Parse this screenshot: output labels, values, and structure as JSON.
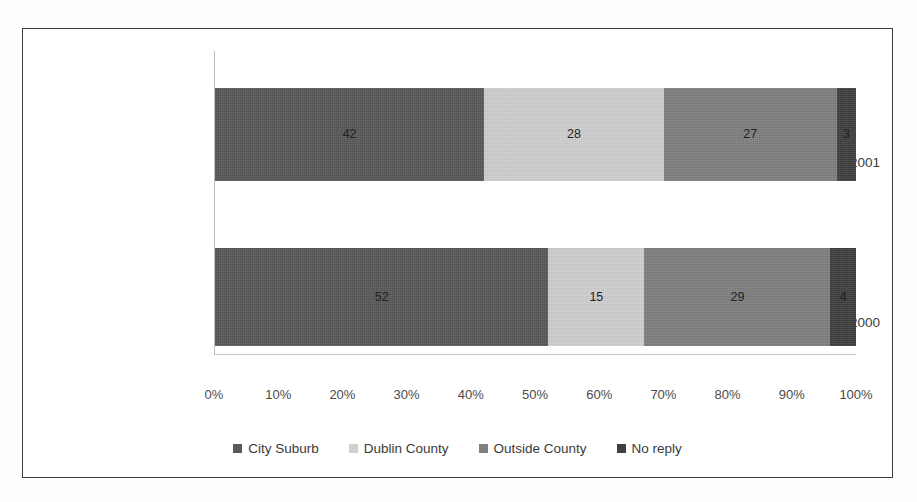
{
  "chart_data": {
    "type": "bar",
    "orientation": "horizontal",
    "stacked": true,
    "stack_mode": "percent",
    "title": "",
    "subtitle": "",
    "xlabel": "",
    "ylabel": "",
    "xlim": [
      0,
      100
    ],
    "grid": false,
    "legend_position": "bottom",
    "categories": [
      "Point of Origin 2001",
      "Point of Origin 2000"
    ],
    "x_tick_labels": [
      "0%",
      "10%",
      "20%",
      "30%",
      "40%",
      "50%",
      "60%",
      "70%",
      "80%",
      "90%",
      "100%"
    ],
    "x_tick_values": [
      0,
      10,
      20,
      30,
      40,
      50,
      60,
      70,
      80,
      90,
      100
    ],
    "series": [
      {
        "name": "City Suburb",
        "color": "#595959",
        "values": [
          42,
          52
        ]
      },
      {
        "name": "Dublin County",
        "color": "#d0d0d0",
        "values": [
          28,
          15
        ]
      },
      {
        "name": "Outside County",
        "color": "#808080",
        "values": [
          27,
          29
        ]
      },
      {
        "name": "No reply",
        "color": "#404040",
        "values": [
          3,
          4
        ]
      }
    ],
    "data_labels": {
      "Point of Origin 2001": [
        "42",
        "28",
        "27",
        "3"
      ],
      "Point of Origin 2000": [
        "52",
        "15",
        "29",
        "4"
      ]
    },
    "rows": [
      {
        "category": "Point of Origin 2001",
        "segments": [
          {
            "label": "City Suburb",
            "value": 42,
            "text": "42",
            "color": "#595959"
          },
          {
            "label": "Dublin County",
            "value": 28,
            "text": "28",
            "color": "#d0d0d0"
          },
          {
            "label": "Outside County",
            "value": 27,
            "text": "27",
            "color": "#808080"
          },
          {
            "label": "No reply",
            "value": 3,
            "text": "3",
            "color": "#404040"
          }
        ]
      },
      {
        "category": "Point of Origin 2000",
        "segments": [
          {
            "label": "City Suburb",
            "value": 52,
            "text": "52",
            "color": "#595959"
          },
          {
            "label": "Dublin County",
            "value": 15,
            "text": "15",
            "color": "#d0d0d0"
          },
          {
            "label": "Outside County",
            "value": 29,
            "text": "29",
            "color": "#808080"
          },
          {
            "label": "No reply",
            "value": 4,
            "text": "4",
            "color": "#404040"
          }
        ]
      }
    ]
  },
  "legend": {
    "items": [
      {
        "label": "City Suburb",
        "color": "#595959"
      },
      {
        "label": "Dublin County",
        "color": "#d0d0d0"
      },
      {
        "label": "Outside County",
        "color": "#808080"
      },
      {
        "label": "No reply",
        "color": "#404040"
      }
    ]
  },
  "colors": {
    "frame_border": "#3c3c3c",
    "axis_line": "#bdbdbd",
    "tick_text": "#4a4a4a",
    "label_text": "#3a3a3a",
    "value_text": "#1e1e1e",
    "background": "#ffffff"
  }
}
